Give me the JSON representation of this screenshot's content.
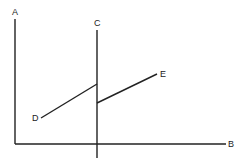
{
  "diagram": {
    "labels": {
      "A": "A",
      "B": "B",
      "C": "C",
      "D": "D",
      "E": "E"
    },
    "stroke_color": "#222222",
    "background": "#ffffff",
    "lines": [
      {
        "name": "vertical-axis-A",
        "x1": 15,
        "y1": 19,
        "x2": 15,
        "y2": 144
      },
      {
        "name": "horizontal-axis-B",
        "x1": 15,
        "y1": 144,
        "x2": 226,
        "y2": 144
      },
      {
        "name": "vertical-line-C",
        "x1": 97,
        "y1": 30,
        "x2": 97,
        "y2": 158
      },
      {
        "name": "segment-D",
        "x1": 41,
        "y1": 118,
        "x2": 97,
        "y2": 84
      },
      {
        "name": "segment-E",
        "x1": 97,
        "y1": 103,
        "x2": 157,
        "y2": 74
      }
    ]
  }
}
